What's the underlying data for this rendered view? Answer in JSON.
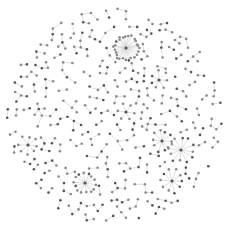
{
  "diagram": {
    "type": "network-graph",
    "layout": "force-directed-circular",
    "width": 228,
    "height": 236,
    "center": [
      114,
      116
    ],
    "radius": 108,
    "colors": {
      "background": "#ffffff",
      "edge": "#c8c8c8",
      "node_dark": "#555555",
      "node_light": "#8a8a8a"
    },
    "hubs": [
      {
        "id": "hub-top",
        "x": 126,
        "y": 48,
        "spokes": 26,
        "spoke_radius": 12
      },
      {
        "id": "hub-right-a",
        "x": 162,
        "y": 141,
        "spokes": 10,
        "spoke_radius": 10
      },
      {
        "id": "hub-right-b",
        "x": 181,
        "y": 150,
        "spokes": 12,
        "spoke_radius": 12
      },
      {
        "id": "hub-bottom-left",
        "x": 85,
        "y": 183,
        "spokes": 14,
        "spoke_radius": 10
      },
      {
        "id": "hub-left",
        "x": 28,
        "y": 145,
        "spokes": 8,
        "spoke_radius": 9
      },
      {
        "id": "hub-bottom-right",
        "x": 172,
        "y": 181,
        "spokes": 10,
        "spoke_radius": 11
      },
      {
        "id": "hub-mid-right",
        "x": 159,
        "y": 80,
        "spokes": 7,
        "spoke_radius": 9
      },
      {
        "id": "hub-center",
        "x": 126,
        "y": 112,
        "spokes": 6,
        "spoke_radius": 8
      }
    ],
    "seed": 7,
    "scatter_nodes": 360,
    "node_radius": 1.3
  }
}
